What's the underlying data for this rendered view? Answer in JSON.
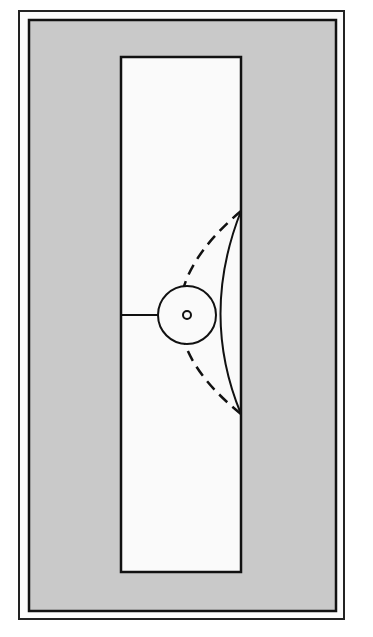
{
  "diagram": {
    "type": "schematic-plan",
    "colors": {
      "background": "#ffffff",
      "outer_border": "#222222",
      "frame_fill": "#c9c9c9",
      "inner_panel": "#fafafa",
      "stroke": "#111111"
    },
    "elements": {
      "outer_border": {
        "x": 19,
        "y": 11,
        "width": 325,
        "height": 608
      },
      "gray_frame": {
        "x": 29,
        "y": 20,
        "width": 307,
        "height": 591
      },
      "white_panel": {
        "x": 121,
        "y": 57,
        "width": 120,
        "height": 515
      },
      "circle": {
        "cx": 187,
        "cy": 315,
        "r": 29
      },
      "center_dot": {
        "cx": 187,
        "cy": 315,
        "r": 4
      },
      "horizontal_line": {
        "x1": 121,
        "y1": 315,
        "x2": 158,
        "y2": 315
      },
      "solid_arc": {
        "start": [
          241,
          211
        ],
        "control": [
          200,
          315
        ],
        "end": [
          241,
          414
        ]
      },
      "dashed_arc": {
        "start": [
          241,
          211
        ],
        "control": [
          118,
          315
        ],
        "end": [
          241,
          414
        ]
      }
    }
  }
}
